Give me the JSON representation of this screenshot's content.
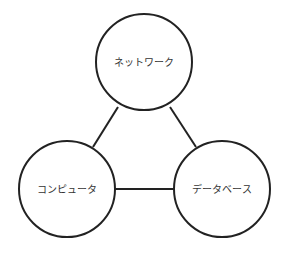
{
  "diagram": {
    "nodes": [
      {
        "id": "network",
        "label": "ネットワーク",
        "cx": 144,
        "cy": 62,
        "r": 48
      },
      {
        "id": "computer",
        "label": "コンピュータ",
        "cx": 67,
        "cy": 188,
        "r": 48
      },
      {
        "id": "database",
        "label": "データベース",
        "cx": 222,
        "cy": 188,
        "r": 48
      }
    ],
    "edges": [
      {
        "from": "network",
        "to": "computer"
      },
      {
        "from": "network",
        "to": "database"
      },
      {
        "from": "computer",
        "to": "database"
      }
    ],
    "colors": {
      "stroke": "#222222",
      "background": "#ffffff",
      "text": "#333333"
    }
  }
}
